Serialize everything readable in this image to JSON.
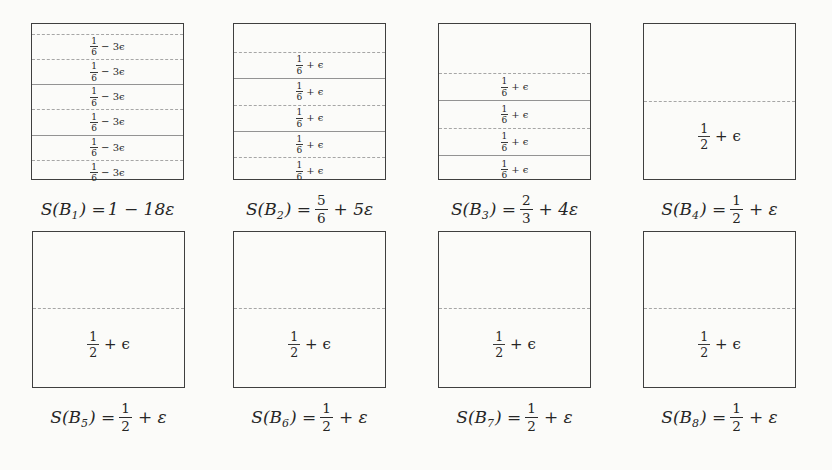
{
  "figure": {
    "type": "bin-packing-diagram",
    "background_color": "#fbfbf9",
    "box_border_color": "#3f3f3f",
    "divider_dashed_color": "#a6a6a6",
    "divider_solid_color": "#939393",
    "text_color": "#262626"
  },
  "bins": [
    {
      "id": "B1",
      "sum": {
        "pre": "S(B",
        "sub": "1",
        "mid": ") = ",
        "tail": "1 − 18ε"
      },
      "items": [
        {
          "num": "1",
          "den": "6",
          "tail": "− 3ϵ"
        },
        {
          "num": "1",
          "den": "6",
          "tail": "− 3ϵ"
        },
        {
          "num": "1",
          "den": "6",
          "tail": "− 3ϵ"
        },
        {
          "num": "1",
          "den": "6",
          "tail": "− 3ϵ"
        },
        {
          "num": "1",
          "den": "6",
          "tail": "− 3ϵ"
        },
        {
          "num": "1",
          "den": "6",
          "tail": "− 3ϵ"
        }
      ]
    },
    {
      "id": "B2",
      "sum": {
        "pre": "S(B",
        "sub": "2",
        "mid": ") =",
        "fnum": "5",
        "fden": "6",
        "tail": "+ 5ε"
      },
      "items": [
        {
          "num": "1",
          "den": "6",
          "tail": "+ ϵ"
        },
        {
          "num": "1",
          "den": "6",
          "tail": "+ ϵ"
        },
        {
          "num": "1",
          "den": "6",
          "tail": "+ ϵ"
        },
        {
          "num": "1",
          "den": "6",
          "tail": "+ ϵ"
        },
        {
          "num": "1",
          "den": "6",
          "tail": "+ ϵ"
        }
      ]
    },
    {
      "id": "B3",
      "sum": {
        "pre": "S(B",
        "sub": "3",
        "mid": ") =",
        "fnum": "2",
        "fden": "3",
        "tail": "+ 4ε"
      },
      "items": [
        {
          "num": "1",
          "den": "6",
          "tail": "+ ϵ"
        },
        {
          "num": "1",
          "den": "6",
          "tail": "+ ϵ"
        },
        {
          "num": "1",
          "den": "6",
          "tail": "+ ϵ"
        },
        {
          "num": "1",
          "den": "6",
          "tail": "+ ϵ"
        }
      ]
    },
    {
      "id": "B4",
      "sum": {
        "pre": "S(B",
        "sub": "4",
        "mid": ") =",
        "fnum": "1",
        "fden": "2",
        "tail": "+ ε"
      },
      "items": [
        {
          "num": "1",
          "den": "2",
          "tail": "+ ϵ"
        }
      ]
    },
    {
      "id": "B5",
      "sum": {
        "pre": "S(B",
        "sub": "5",
        "mid": ") =",
        "fnum": "1",
        "fden": "2",
        "tail": "+ ε"
      },
      "items": [
        {
          "num": "1",
          "den": "2",
          "tail": "+ ϵ"
        }
      ]
    },
    {
      "id": "B6",
      "sum": {
        "pre": "S(B",
        "sub": "6",
        "mid": ") =",
        "fnum": "1",
        "fden": "2",
        "tail": "+ ε"
      },
      "items": [
        {
          "num": "1",
          "den": "2",
          "tail": "+ ϵ"
        }
      ]
    },
    {
      "id": "B7",
      "sum": {
        "pre": "S(B",
        "sub": "7",
        "mid": ") =",
        "fnum": "1",
        "fden": "2",
        "tail": "+ ε"
      },
      "items": [
        {
          "num": "1",
          "den": "2",
          "tail": "+ ϵ"
        }
      ]
    },
    {
      "id": "B8",
      "sum": {
        "pre": "S(B",
        "sub": "8",
        "mid": ") =",
        "fnum": "1",
        "fden": "2",
        "tail": "+ ε"
      },
      "items": [
        {
          "num": "1",
          "den": "2",
          "tail": "+ ϵ"
        }
      ]
    }
  ]
}
